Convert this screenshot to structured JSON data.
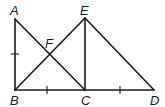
{
  "diagram": {
    "type": "geometry",
    "points": {
      "A": {
        "label": "A",
        "x": 15,
        "y": 19
      },
      "B": {
        "label": "B",
        "x": 15,
        "y": 90
      },
      "C": {
        "label": "C",
        "x": 85,
        "y": 90
      },
      "D": {
        "label": "D",
        "x": 154,
        "y": 90
      },
      "E": {
        "label": "E",
        "x": 85,
        "y": 18
      },
      "F": {
        "label": "F",
        "x": 50,
        "y": 54
      }
    },
    "segments": [
      "AB",
      "BC",
      "CD",
      "AC",
      "BE",
      "EC",
      "ED"
    ],
    "congruence_ticks": [
      "AB",
      "BC",
      "CD"
    ],
    "labels": {
      "A": "A",
      "B": "B",
      "C": "C",
      "D": "D",
      "E": "E",
      "F": "F"
    }
  }
}
